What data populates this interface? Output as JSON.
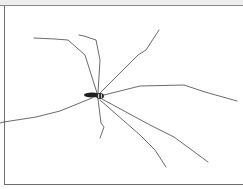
{
  "image": {
    "subject": "long-legged spider on white background",
    "colors": {
      "background": "#ffffff",
      "legs": "#555555",
      "body": "#1e1e1e",
      "frame": "#6e6e6e"
    }
  }
}
